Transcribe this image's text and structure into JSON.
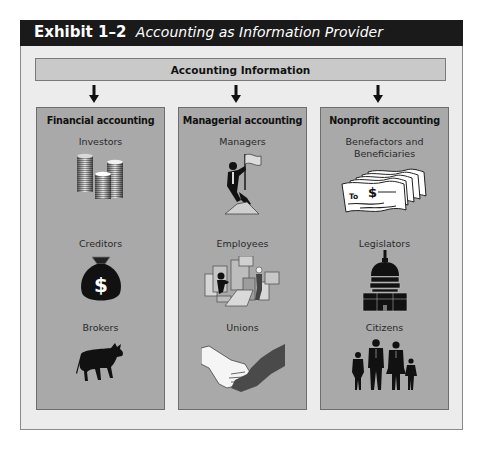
{
  "exhibit": {
    "number": "Exhibit 1–2",
    "title": "Accounting as Information Provider"
  },
  "banner": {
    "label": "Accounting Information"
  },
  "columns": [
    {
      "title": "Financial accounting",
      "groups": [
        {
          "label": "Investors",
          "icon": "coin-stacks-icon"
        },
        {
          "label": "Creditors",
          "icon": "money-bag-icon"
        },
        {
          "label": "Brokers",
          "icon": "bull-icon"
        }
      ]
    },
    {
      "title": "Managerial accounting",
      "groups": [
        {
          "label": "Managers",
          "icon": "climber-with-flag-icon"
        },
        {
          "label": "Employees",
          "icon": "office-workers-icon"
        },
        {
          "label": "Unions",
          "icon": "handshake-icon"
        }
      ]
    },
    {
      "title": "Nonprofit accounting",
      "groups": [
        {
          "label": "Benefactors and Beneficiaries",
          "icon": "checks-icon",
          "check_text": "To",
          "check_symbol": "$"
        },
        {
          "label": "Legislators",
          "icon": "capitol-building-icon"
        },
        {
          "label": "Citizens",
          "icon": "family-icon"
        }
      ]
    }
  ],
  "colors": {
    "header_bg": "#1a1a1a",
    "panel_bg": "#ececec",
    "banner_bg": "#c9c9c9",
    "column_bg": "#a9a9a9"
  }
}
